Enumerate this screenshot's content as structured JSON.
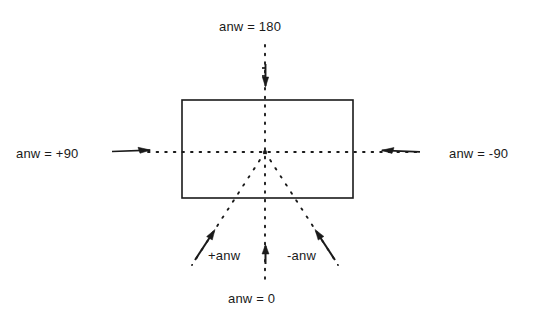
{
  "figure": {
    "title_text": "anw = 180",
    "labels": {
      "top": "anw = 180",
      "left": "anw = +90",
      "right": "anw = -90",
      "bottom": "anw = 0",
      "diagonal_positive": "+anw",
      "diagonal_negative": "-anw"
    },
    "geometry": {
      "center_x": 265,
      "center_y": 152,
      "rect_left": 182,
      "rect_top": 100,
      "rect_right": 353,
      "rect_bottom": 198
    },
    "colors": {
      "stroke": "#1a1a1a",
      "background": "#ffffff"
    },
    "elements": {
      "rectangle_name": "reference-rectangle",
      "vertical_axis_name": "vertical-dotted-axis",
      "horizontal_axis_name": "horizontal-dotted-axis",
      "diagonal_left_name": "positive-angle-dotted-ray",
      "diagonal_right_name": "negative-angle-dotted-ray"
    }
  }
}
